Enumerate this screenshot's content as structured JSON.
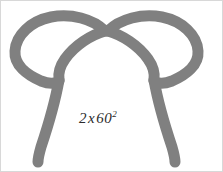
{
  "figure": {
    "background_color": "#ffffff",
    "border_color": "#d8d8d8",
    "stroke_color": "#808080",
    "width": 223,
    "height": 172
  },
  "annotation": {
    "full_text": "2 x 60²",
    "coefficient": "2",
    "operator": "x",
    "base": "60",
    "exponent": "2"
  },
  "shapes": {
    "left": {
      "name": "left-looped-stem",
      "loop_label": "left-loop",
      "stem_label": "left-stem"
    },
    "right": {
      "name": "right-looped-stem",
      "loop_label": "right-loop",
      "stem_label": "right-stem"
    }
  }
}
